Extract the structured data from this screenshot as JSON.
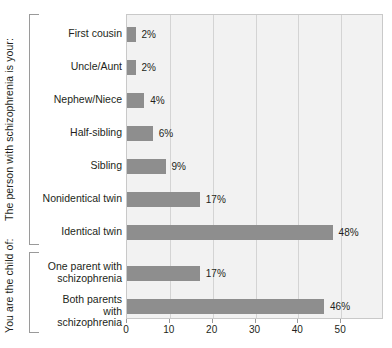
{
  "chart_data": {
    "type": "bar",
    "orientation": "horizontal",
    "title": "",
    "xlabel": "",
    "ylabel": "",
    "xlim": [
      0,
      60
    ],
    "xticks": [
      0,
      10,
      20,
      30,
      40,
      50
    ],
    "xtick_labels": [
      "0",
      "10",
      "20",
      "30",
      "40",
      "50"
    ],
    "grid": true,
    "legend": false,
    "value_suffix": "%",
    "bar_color": "#8e8e8e",
    "plot_background": "#f2f2f2",
    "categories": [
      "First cousin",
      "Uncle/Aunt",
      "Nephew/Niece",
      "Half-sibling",
      "Sibling",
      "Nonidentical twin",
      "Identical twin",
      "One parent with\nschizophrenia",
      "Both parents with\nschizophrenia"
    ],
    "values": [
      2,
      2,
      4,
      6,
      9,
      17,
      48,
      17,
      46
    ],
    "value_labels": [
      "2%",
      "2%",
      "4%",
      "6%",
      "9%",
      "17%",
      "48%",
      "17%",
      "46%"
    ],
    "groups": [
      {
        "label": "The person with schizophrenia is your:",
        "category_indices": [
          0,
          1,
          2,
          3,
          4,
          5,
          6
        ]
      },
      {
        "label": "You are the child of:",
        "category_indices": [
          7,
          8
        ]
      }
    ]
  }
}
